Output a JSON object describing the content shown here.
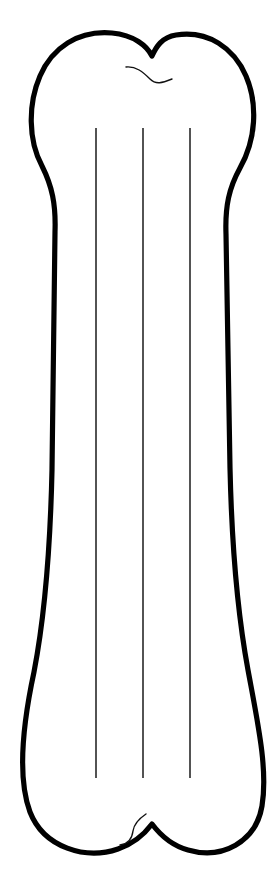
{
  "page": {
    "background_color": "#ffffff",
    "width": 280,
    "height": 879,
    "orientation": "portrait"
  },
  "artwork": {
    "subject": "bone",
    "style": "line-art-outline",
    "description": "Black outline drawing of a classic dog bone shape with two rounded lobes at the top and two rounded lobes at the bottom, oriented vertically.",
    "outline": {
      "name": "bone-outline",
      "stroke_color": "#000000",
      "fill_color": "#ffffff",
      "stroke_width": 5.2,
      "path": "M 112 33 C 78 30 52 48 40 76 C 28 104 28 140 42 166 C 52 186 56 204 55 232 L 52 470 C 50 560 44 620 34 672 C 22 728 18 780 30 812 C 44 848 86 860 118 849 C 136 843 146 832 152 824 C 158 832 170 845 188 850 C 222 860 256 842 262 806 C 268 770 258 724 248 670 C 238 616 232 556 230 468 L 226 234 C 225 206 229 188 240 168 C 256 140 258 104 246 76 C 234 48 208 30 176 35 C 162 37 156 47 152 56 C 147 46 134 35 112 33 Z"
    },
    "shaft_lines": [
      {
        "name": "shaft-line-left",
        "x": 96,
        "y1": 128,
        "y2": 778,
        "stroke_color": "#1a1a1a",
        "stroke_width": 1.5
      },
      {
        "name": "shaft-line-center",
        "x": 143,
        "y1": 128,
        "y2": 778,
        "stroke_color": "#1a1a1a",
        "stroke_width": 1.5
      },
      {
        "name": "shaft-line-right",
        "x": 190,
        "y1": 128,
        "y2": 778,
        "stroke_color": "#1a1a1a",
        "stroke_width": 1.5
      }
    ],
    "accents": [
      {
        "name": "top-notch-accent",
        "description": "Thin curved detail line under the V notch between the two upper lobes",
        "stroke_color": "#111111",
        "stroke_width": 1.4,
        "path": "M 126 67 C 136 66 143 72 150 79 C 156 85 162 83 172 79"
      },
      {
        "name": "bottom-notch-accent",
        "description": "Thin S-curve detail line above the notch between the two lower lobes",
        "stroke_color": "#111111",
        "stroke_width": 1.4,
        "path": "M 146 814 C 140 818 134 824 133 831 C 132 839 128 844 120 845"
      }
    ]
  }
}
